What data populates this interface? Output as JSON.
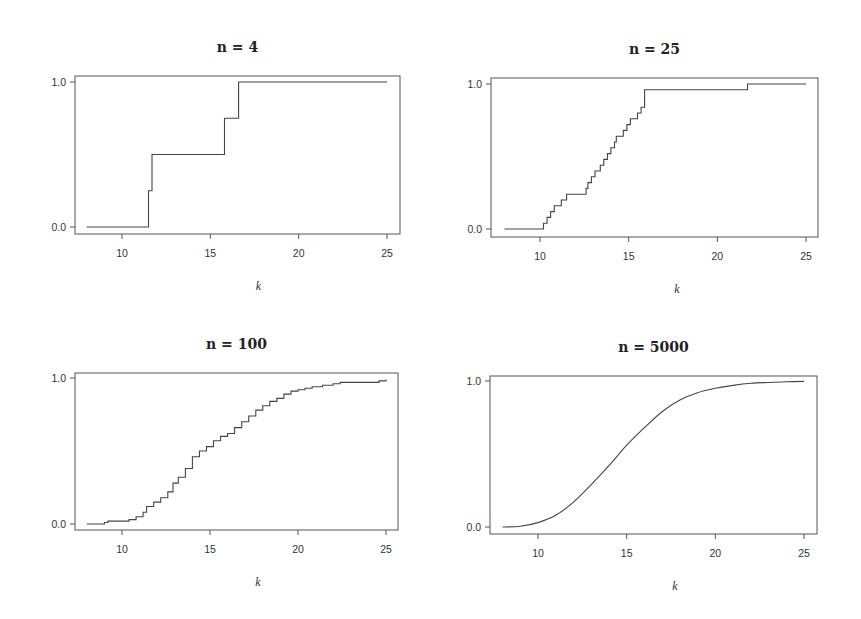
{
  "chart_data": [
    {
      "type": "line",
      "step": true,
      "title": "n = 4",
      "xlabel": "k",
      "ylabel": "",
      "xlim": [
        7.3,
        25.8
      ],
      "ylim": [
        -0.04,
        1.04
      ],
      "xticks": [
        10,
        15,
        20,
        25
      ],
      "yticks": [
        0.0,
        1.0
      ],
      "ytick_labels": [
        "0.0",
        "1.0"
      ],
      "grid": false,
      "series": [
        {
          "name": "ECDF n=4",
          "x": [
            8,
            11.5,
            11.5,
            11.7,
            11.7,
            15.8,
            15.8,
            16.6,
            16.6,
            25
          ],
          "y": [
            0,
            0,
            0.25,
            0.25,
            0.5,
            0.5,
            0.75,
            0.75,
            1.0,
            1.0
          ]
        }
      ]
    },
    {
      "type": "line",
      "step": true,
      "title": "n = 25",
      "xlabel": "k",
      "ylabel": "",
      "xlim": [
        7.3,
        25.8
      ],
      "ylim": [
        -0.04,
        1.04
      ],
      "xticks": [
        10,
        15,
        20,
        25
      ],
      "yticks": [
        0.0,
        1.0
      ],
      "ytick_labels": [
        "0.0",
        "1.0"
      ],
      "grid": false,
      "series": [
        {
          "name": "ECDF n=25",
          "x": [
            8,
            10.2,
            10.4,
            10.6,
            10.8,
            11.2,
            11.5,
            12.6,
            12.7,
            12.9,
            13.1,
            13.4,
            13.6,
            13.8,
            14.0,
            14.2,
            14.3,
            14.7,
            14.9,
            15.1,
            15.5,
            15.7,
            15.9,
            21.7,
            25
          ],
          "y": [
            0,
            0.04,
            0.08,
            0.12,
            0.16,
            0.2,
            0.24,
            0.28,
            0.32,
            0.36,
            0.4,
            0.44,
            0.48,
            0.52,
            0.56,
            0.6,
            0.64,
            0.68,
            0.72,
            0.76,
            0.8,
            0.84,
            0.96,
            1.0,
            1.0
          ]
        }
      ]
    },
    {
      "type": "line",
      "step": true,
      "title": "n = 100",
      "xlabel": "k",
      "ylabel": "",
      "xlim": [
        7.3,
        25.8
      ],
      "ylim": [
        -0.04,
        1.04
      ],
      "xticks": [
        10,
        15,
        20,
        25
      ],
      "yticks": [
        0.0,
        1.0
      ],
      "ytick_labels": [
        "0.0",
        "1.0"
      ],
      "grid": false,
      "series": [
        {
          "name": "ECDF n=100",
          "x": [
            8,
            9.0,
            9.2,
            10.4,
            10.8,
            11.2,
            11.4,
            11.8,
            12.2,
            12.6,
            12.9,
            13.2,
            13.6,
            14.0,
            14.4,
            14.8,
            15.2,
            15.6,
            16.0,
            16.4,
            16.8,
            17.2,
            17.6,
            18.0,
            18.4,
            18.8,
            19.2,
            19.6,
            20.0,
            20.4,
            20.8,
            21.4,
            22.0,
            22.4,
            24.6,
            25.0
          ],
          "y": [
            0,
            0.01,
            0.02,
            0.03,
            0.05,
            0.08,
            0.12,
            0.15,
            0.18,
            0.22,
            0.28,
            0.32,
            0.38,
            0.46,
            0.5,
            0.53,
            0.57,
            0.6,
            0.62,
            0.66,
            0.7,
            0.74,
            0.78,
            0.81,
            0.84,
            0.86,
            0.89,
            0.91,
            0.92,
            0.93,
            0.94,
            0.95,
            0.96,
            0.97,
            0.98,
            0.99
          ]
        }
      ]
    },
    {
      "type": "line",
      "step": false,
      "title": "n = 5000",
      "xlabel": "k",
      "ylabel": "",
      "xlim": [
        7.3,
        25.8
      ],
      "ylim": [
        -0.04,
        1.04
      ],
      "xticks": [
        10,
        15,
        20,
        25
      ],
      "yticks": [
        0.0,
        1.0
      ],
      "ytick_labels": [
        "0.0",
        "1.0"
      ],
      "grid": false,
      "series": [
        {
          "name": "ECDF n=5000",
          "x": [
            8,
            9,
            10,
            11,
            12,
            13,
            14,
            15,
            16,
            17,
            18,
            19,
            20,
            21,
            22,
            23,
            24,
            25
          ],
          "y": [
            0.0,
            0.005,
            0.03,
            0.08,
            0.17,
            0.29,
            0.42,
            0.56,
            0.68,
            0.79,
            0.87,
            0.92,
            0.95,
            0.97,
            0.985,
            0.99,
            0.995,
            0.997
          ]
        }
      ]
    }
  ],
  "panels": [
    {
      "title": "n = 4",
      "xlabel": "k",
      "box": {
        "left": 75,
        "top": 76,
        "right": 400,
        "bottom": 234
      },
      "y0px": 227,
      "y1px": 82,
      "x10px": 122,
      "x25px": 387
    },
    {
      "title": "n = 25",
      "xlabel": "k",
      "box": {
        "left": 491,
        "top": 78,
        "right": 818,
        "bottom": 237
      },
      "y0px": 229,
      "y1px": 84,
      "x10px": 540,
      "x25px": 806
    },
    {
      "title": "n = 100",
      "xlabel": "k",
      "box": {
        "left": 75,
        "top": 373,
        "right": 398,
        "bottom": 530
      },
      "y0px": 524,
      "y1px": 378,
      "x10px": 122,
      "x25px": 386
    },
    {
      "title": "n = 5000",
      "xlabel": "k",
      "box": {
        "left": 490,
        "top": 376,
        "right": 817,
        "bottom": 534
      },
      "y0px": 527,
      "y1px": 381,
      "x10px": 538,
      "x25px": 804
    }
  ]
}
